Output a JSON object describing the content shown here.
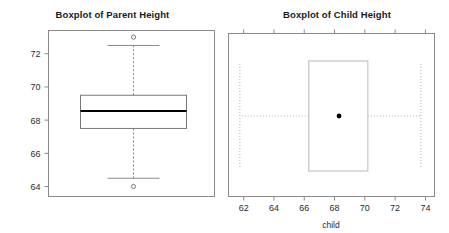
{
  "page": {
    "background_color": "#ffffff",
    "panel_count": 2
  },
  "chart_data": [
    {
      "type": "box",
      "id": "parent-height-boxplot",
      "title": "Boxplot of Parent Height",
      "orientation": "vertical",
      "xlabel": "",
      "ylabel": "",
      "ylim": [
        63.4,
        73.4
      ],
      "yticks": [
        64,
        66,
        68,
        70,
        72
      ],
      "ytick_labels": [
        "64",
        "66",
        "68",
        "70",
        "72"
      ],
      "grid": false,
      "legend": "none",
      "frame": true,
      "box_color": "#777777",
      "median_color": "#000000",
      "whisker_style": "dashed",
      "boxes": [
        {
          "name": "parent",
          "min_whisker": 64.5,
          "q1": 67.5,
          "median": 68.55,
          "q3": 69.5,
          "max_whisker": 72.5,
          "outliers": [
            64.0,
            73.0
          ]
        }
      ]
    },
    {
      "type": "box",
      "id": "child-height-boxplot",
      "title": "Boxplot of Child Height",
      "orientation": "horizontal",
      "xlabel": "child",
      "ylabel": "",
      "xlim": [
        61.0,
        74.6
      ],
      "xticks": [
        62,
        64,
        66,
        68,
        70,
        72,
        74
      ],
      "xtick_labels": [
        "62",
        "64",
        "66",
        "68",
        "70",
        "72",
        "74"
      ],
      "grid": false,
      "legend": "none",
      "frame": true,
      "box_color": "#b8b8b8",
      "median_color": "#000000",
      "median_marker": "filled-circle",
      "whisker_style": "dotted",
      "ticks_on_top_axis": true,
      "boxes": [
        {
          "name": "child",
          "min_whisker": 61.75,
          "q1": 66.3,
          "median": 68.3,
          "q3": 70.2,
          "max_whisker": 73.7,
          "outliers": []
        }
      ]
    }
  ],
  "panels": {
    "left": {
      "title": "Boxplot of Parent Height",
      "ytick_labels": [
        "64",
        "66",
        "68",
        "70",
        "72"
      ]
    },
    "right": {
      "title": "Boxplot of Child Height",
      "xtick_labels": [
        "62",
        "64",
        "66",
        "68",
        "70",
        "72",
        "74"
      ],
      "axis_title": "child"
    }
  }
}
